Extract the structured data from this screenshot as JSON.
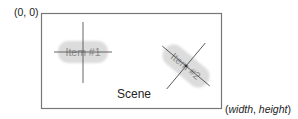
{
  "origin_label": "(0, 0)",
  "size_label": {
    "open": "(",
    "width": "width",
    "sep": ", ",
    "height": "height",
    "close": ")"
  },
  "scene": {
    "label": "Scene",
    "border_color": "#777777"
  },
  "items": [
    {
      "label": "Item #1",
      "rotation_deg": 0,
      "fill": "#dcdcdc"
    },
    {
      "label": "Item #2",
      "rotation_deg": 40,
      "fill": "#dcdcdc"
    }
  ],
  "colors": {
    "axis_line": "#555555",
    "text": "#222222",
    "item_text": "#8a8a8a"
  }
}
